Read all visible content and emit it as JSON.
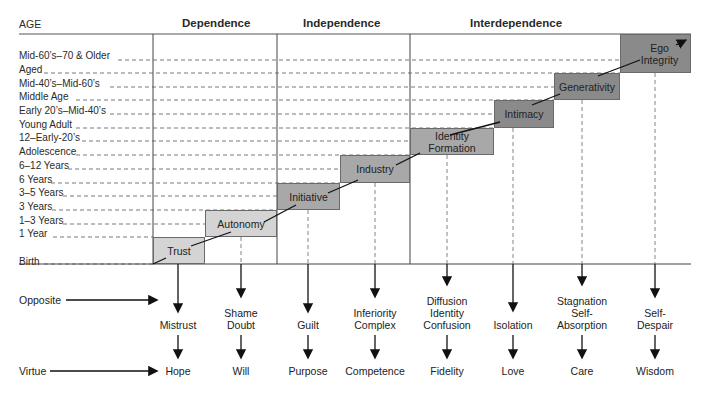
{
  "header": {
    "age_label": "AGE",
    "columns": [
      "Dependence",
      "Independence",
      "Interdependence"
    ]
  },
  "ages": [
    "Mid-60’s–70 & Older",
    "Aged",
    "Mid-40’s–Mid-60’s",
    "Middle Age",
    "Early 20’s–Mid-40’s",
    "Young Adult",
    "12–Early-20’s",
    "Adolescence",
    "6–12 Years",
    "6 Years",
    "3–5 Years",
    "3 Years",
    "1–3 Years",
    "1 Year",
    "Birth"
  ],
  "stages": [
    {
      "name": "Trust",
      "opposite": "Mistrust",
      "virtue": "Hope"
    },
    {
      "name": "Autonomy",
      "opposite": "Shame\nDoubt",
      "virtue": "Will"
    },
    {
      "name": "Initiative",
      "opposite": "Guilt",
      "virtue": "Purpose"
    },
    {
      "name": "Industry",
      "opposite": "Inferiority\nComplex",
      "virtue": "Competence"
    },
    {
      "name": "Identity\nFormation",
      "opposite": "Diffusion\nIdentity\nConfusion",
      "virtue": "Fidelity"
    },
    {
      "name": "Intimacy",
      "opposite": "Isolation",
      "virtue": "Love"
    },
    {
      "name": "Generativity",
      "opposite": "Stagnation\nSelf-\nAbsorption",
      "virtue": "Care"
    },
    {
      "name": "Ego\nIntegrity",
      "opposite": "Self-\nDespair",
      "virtue": "Wisdom"
    }
  ],
  "row_labels": {
    "opposite": "Opposite",
    "virtue": "Virtue"
  },
  "colors": {
    "light_box": "#d4d4d4",
    "mid_box": "#a8a8a8",
    "dark_box": "#8a8a8a",
    "lines": "#444444"
  }
}
